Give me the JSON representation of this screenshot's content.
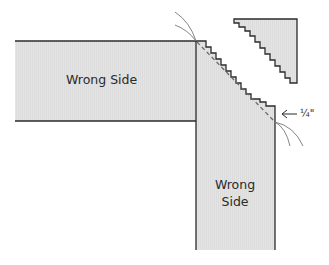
{
  "diagram": {
    "type": "sewing-mitered-seam",
    "colors": {
      "fabric_fill": "#e3e3e3",
      "outline": "#2b2b2b",
      "dashed_seam": "#6a6a6a",
      "thread": "#777777",
      "background": "#ffffff"
    },
    "horizontal_strip": {
      "label": "Wrong Side"
    },
    "vertical_strip": {
      "label_line1": "Wrong",
      "label_line2": "Side"
    },
    "seam_allowance": {
      "label": "¼\"",
      "arrow": "left-arrow"
    },
    "trimmed_triangle": {
      "edge": "pinked"
    }
  }
}
